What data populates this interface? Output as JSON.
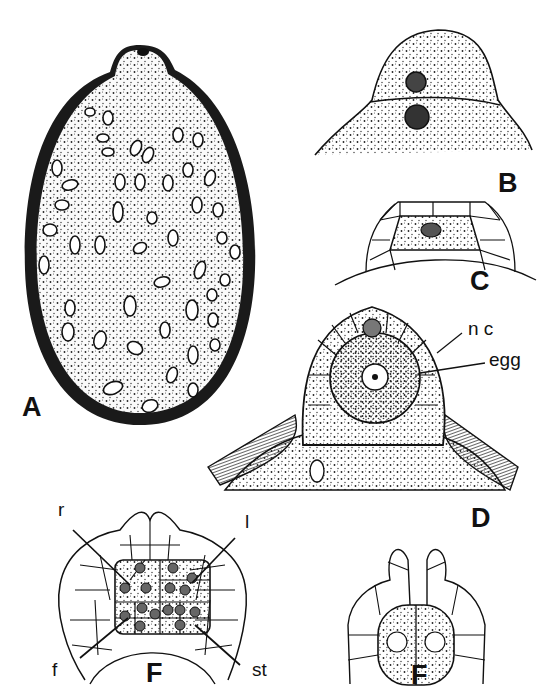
{
  "figure": {
    "panels": [
      {
        "id": "A",
        "letter": "A",
        "description": "oval cell with thick wall, cytoplasm filled with many oval plastids/granules and vacuoles"
      },
      {
        "id": "B",
        "letter": "B",
        "description": "dome-shaped apex divided by a curved wall, two dark nuclei"
      },
      {
        "id": "C",
        "letter": "C",
        "description": "dome with small cells surrounding a central stippled cell with one nucleus"
      },
      {
        "id": "D",
        "letter": "D",
        "description": "archegonium in section: jacket cells surrounding large egg, neck canal cell above",
        "labels": {
          "nc": "n c",
          "egg": "egg"
        }
      },
      {
        "id": "E",
        "letter": "F",
        "description": "cellular dome with central block of many nucleated cells",
        "labels": {
          "r": "r",
          "l": "l",
          "f": "f",
          "st": "st"
        }
      },
      {
        "id": "F",
        "letter": "F",
        "description": "cellular dome with central two-celled body, each with nucleus"
      }
    ]
  },
  "colors": {
    "ink": "#111111",
    "paper": "#ffffff",
    "stipple": "#3a3a3a"
  }
}
